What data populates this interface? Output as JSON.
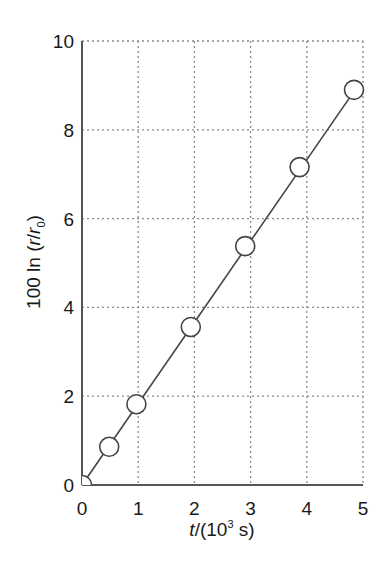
{
  "chart_data": {
    "type": "line",
    "title": "",
    "xlabel": "t/(10^3 s)",
    "xlabel_parts": {
      "var": "t",
      "pre": "/(10",
      "sup": "3",
      "post": " s)"
    },
    "ylabel": "100 ln (r/r0)",
    "ylabel_parts": {
      "pre": "100 ln (",
      "r": "r",
      "slash": "/",
      "r0": "r",
      "sub": "0",
      "post": ")"
    },
    "xlim": [
      0,
      5
    ],
    "ylim": [
      0,
      10
    ],
    "x_ticks": [
      "0",
      "1",
      "2",
      "3",
      "4",
      "5"
    ],
    "y_ticks": [
      "0",
      "2",
      "4",
      "6",
      "8",
      "10"
    ],
    "grid": "dotted",
    "legend": null,
    "series": [
      {
        "name": "100 ln(r/r0)",
        "marker": "open-circle",
        "x": [
          0,
          0.5,
          1,
          2,
          3,
          4,
          5
        ],
        "values": [
          0,
          0.86,
          1.82,
          3.56,
          5.38,
          7.16,
          8.9
        ]
      }
    ],
    "fit_line": {
      "x": [
        0,
        5
      ],
      "y": [
        0,
        8.9
      ]
    }
  }
}
